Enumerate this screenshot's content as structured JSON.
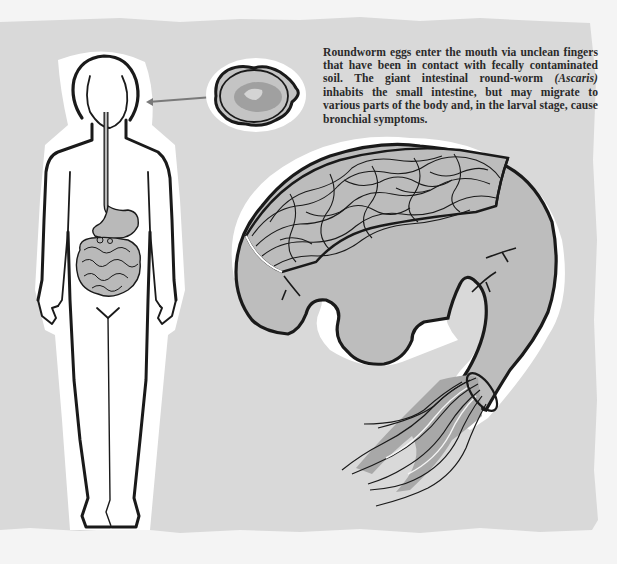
{
  "caption": {
    "part1": "Roundworm eggs enter the mouth via unclean fingers that have been in contact with fecally contaminated soil. The giant intestinal round-worm ",
    "species": "(Ascaris)",
    "part2": " inhabits the small intestine, but may migrate to various parts of the body and, in the larval stage, cause bronchial symptoms."
  },
  "illustration": {
    "figures": [
      "human-body-outline",
      "digestive-tract",
      "roundworm-egg",
      "intestine-cutaway-with-worms",
      "emerging-worms"
    ],
    "colors": {
      "page": "#f4f4f4",
      "backdrop": "#d9d9d9",
      "figure_fill": "#ffffff",
      "organ_fill": "#b9b9b9",
      "worm_fill": "#a8a8a8",
      "outline": "#1a1a1a",
      "arrow": "#7a7a7a"
    }
  }
}
